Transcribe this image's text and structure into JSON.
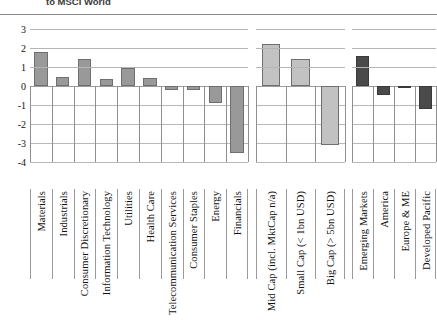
{
  "title": {
    "line_visible": "to MSCI World"
  },
  "chart_data": {
    "type": "bar",
    "title": "to MSCI World",
    "xlabel": "",
    "ylabel": "",
    "ylim": [
      -4,
      3
    ],
    "yticks": [
      3,
      2,
      1,
      0,
      -1,
      -2,
      -3,
      -4
    ],
    "grid": true,
    "legend": "none",
    "panels": [
      {
        "name": "sectors",
        "fill": "#999999",
        "categories": [
          "Materials",
          "Industrials",
          "Consumer Discretionary",
          "Information Technology",
          "Utilities",
          "Health Care",
          "Telecommunication Services",
          "Consumer Staples",
          "Energy",
          "Financials"
        ],
        "values": [
          1.8,
          0.5,
          1.4,
          0.35,
          0.95,
          0.4,
          -0.2,
          -0.2,
          -0.9,
          -3.5
        ]
      },
      {
        "name": "market-cap",
        "fill": "#c2c2c2",
        "categories": [
          "Mid Cap (incl. MktCap n/a)",
          "Small Cap (< 1bn USD)",
          "Big Cap (> 5bn USD)"
        ],
        "values": [
          2.2,
          1.4,
          -3.1
        ]
      },
      {
        "name": "regions",
        "fill": "#4a4a4a",
        "categories": [
          "Emerging Markets",
          "America",
          "Europe & ME",
          "Developed Pacific"
        ],
        "values": [
          1.6,
          -0.45,
          -0.03,
          -1.2
        ]
      }
    ]
  }
}
